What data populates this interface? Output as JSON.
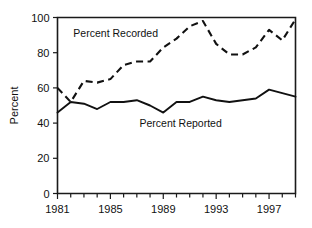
{
  "chart_data": {
    "type": "line",
    "title": "",
    "xlabel": "",
    "ylabel": "Percent",
    "xlim": [
      1981,
      1999
    ],
    "ylim": [
      0,
      100
    ],
    "grid": false,
    "legend_position": "inline-annotations",
    "x": [
      1981,
      1982,
      1983,
      1984,
      1985,
      1986,
      1987,
      1988,
      1989,
      1990,
      1991,
      1992,
      1993,
      1994,
      1995,
      1996,
      1997,
      1998,
      1999
    ],
    "xticks": [
      1981,
      1985,
      1989,
      1993,
      1997
    ],
    "xticklabels": [
      "1981",
      "1985",
      "1989",
      "1993",
      "1997"
    ],
    "yticks": [
      0,
      20,
      40,
      60,
      80,
      100
    ],
    "yticklabels": [
      "0",
      "20",
      "40",
      "60",
      "80",
      "100"
    ],
    "series": [
      {
        "name": "Percent Recorded",
        "style": "dashed",
        "values": [
          60,
          52,
          64,
          63,
          65,
          73,
          75,
          75,
          83,
          88,
          95,
          98,
          85,
          79,
          79,
          83,
          93,
          87,
          99
        ]
      },
      {
        "name": "Percent Reported",
        "style": "solid",
        "values": [
          46,
          52,
          51,
          48,
          52,
          52,
          53,
          50,
          46,
          52,
          52,
          55,
          53,
          52,
          53,
          54,
          59,
          57,
          55
        ]
      }
    ],
    "annotations": [
      {
        "text": "Percent Recorded",
        "x": 1982.2,
        "y": 89
      },
      {
        "text": "Percent Reported",
        "x": 1987.2,
        "y": 38
      }
    ]
  },
  "colors": {
    "ink": "#111111",
    "background": "#ffffff"
  }
}
